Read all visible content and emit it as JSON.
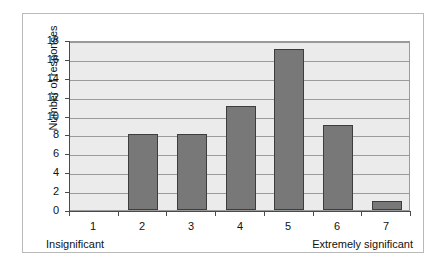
{
  "chart_data": {
    "type": "bar",
    "title": "",
    "xlabel": "",
    "ylabel": "Number of responses",
    "categories": [
      "1",
      "2",
      "3",
      "4",
      "5",
      "6",
      "7"
    ],
    "values": [
      0,
      8,
      8,
      11,
      17,
      9,
      1
    ],
    "ylim": [
      0,
      18
    ],
    "ytick_step": 2,
    "yticks": [
      "18",
      "16",
      "14",
      "12",
      "10",
      "8",
      "6",
      "4",
      "2",
      "0"
    ],
    "grid": "horizontal",
    "legend": "none",
    "annotations": {
      "scale_low_anchor": "Insignificant",
      "scale_high_anchor": "Extremely significant"
    },
    "colors": {
      "bar_fill": "#787878",
      "bar_outline": "#3d3d3d",
      "plot_background": "#ebebeb",
      "gridline": "#9a9a9a",
      "axis": "#4a4a4a",
      "frame_border": "#b9b9b9",
      "page_background": "#ffffff",
      "text": "#111111"
    }
  }
}
